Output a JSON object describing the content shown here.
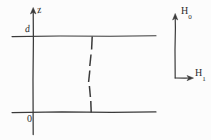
{
  "figure": {
    "type": "hand-drawn-schematic",
    "background_color": "#fcfcfc",
    "ink_color": "#3a3a3a",
    "axes": {
      "vertical_axis_label": "z",
      "upper_boundary_label": "d",
      "lower_boundary_label": "0"
    },
    "field_frame": {
      "vertical_label_base": "H",
      "vertical_label_sub": "0",
      "horizontal_label_base": "H",
      "horizontal_label_sub": "1"
    },
    "geometry": {
      "vertical_axis_x": 33,
      "vertical_axis_top": 8,
      "vertical_axis_bottom": 135,
      "upper_line_y": 36,
      "lower_line_y": 112,
      "horizontal_line_start_x": 12,
      "horizontal_line_end_x": 156,
      "dashed_line_top_x": 92,
      "dashed_line_bottom_x": 91,
      "frame_vertical_x": 175,
      "frame_vertical_top": 14,
      "frame_corner_y": 78,
      "frame_horizontal_end_x": 193
    }
  }
}
